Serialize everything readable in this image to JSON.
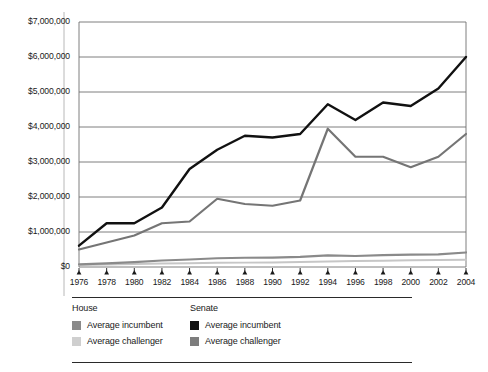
{
  "chart_data": {
    "type": "line",
    "title": "",
    "subtitle": "",
    "xlabel": "",
    "ylabel": "",
    "grid": true,
    "legend_position": "bottom",
    "x": [
      1976,
      1978,
      1980,
      1982,
      1984,
      1986,
      1988,
      1990,
      1992,
      1994,
      1996,
      1998,
      2000,
      2002,
      2004
    ],
    "categories": [
      "1976",
      "1978",
      "1980",
      "1982",
      "1984",
      "1986",
      "1988",
      "1990",
      "1992",
      "1994",
      "1996",
      "1998",
      "2000",
      "2002",
      "2004"
    ],
    "xlim": [
      1976,
      2004
    ],
    "ylim": [
      0,
      7000000
    ],
    "ytick_values": [
      0,
      1000000,
      2000000,
      3000000,
      4000000,
      5000000,
      6000000,
      7000000
    ],
    "ytick_labels": [
      "$0",
      "$1,000,000",
      "$2,000,000",
      "$3,000,000",
      "$4,000,000",
      "$5,000,000",
      "$6,000,000",
      "$7,000,000"
    ],
    "series": [
      {
        "name": "Senate average incumbent",
        "group": "Senate",
        "label": "Average incumbent",
        "color": "#111111",
        "width": 2.4,
        "values": [
          610000,
          1250000,
          1250000,
          1700000,
          2800000,
          3350000,
          3750000,
          3700000,
          3800000,
          4650000,
          4200000,
          4700000,
          4600000,
          5100000,
          6000000
        ]
      },
      {
        "name": "Senate average challenger",
        "group": "Senate",
        "label": "Average challenger",
        "color": "#757575",
        "width": 2.2,
        "values": [
          500000,
          700000,
          900000,
          1250000,
          1300000,
          1950000,
          1800000,
          1750000,
          1900000,
          3950000,
          3150000,
          3150000,
          2850000,
          3150000,
          3800000
        ]
      },
      {
        "name": "House average challenger (light)",
        "group": "House",
        "label": "Average challenger",
        "color": "#c6c6c6",
        "width": 2.0,
        "values": [
          60000,
          70000,
          85000,
          100000,
          110000,
          120000,
          125000,
          130000,
          145000,
          160000,
          170000,
          180000,
          190000,
          200000,
          205000
        ]
      },
      {
        "name": "House average incumbent",
        "group": "House",
        "label": "Average incumbent",
        "color": "#8a8a8a",
        "width": 2.2,
        "values": [
          75000,
          105000,
          140000,
          185000,
          215000,
          250000,
          265000,
          270000,
          290000,
          330000,
          315000,
          340000,
          355000,
          360000,
          415000
        ]
      }
    ]
  },
  "legend": {
    "columns": [
      {
        "heading": "House",
        "entries": [
          {
            "label": "Average incumbent",
            "color": "#8a8a8a"
          },
          {
            "label": "Average challenger",
            "color": "#cfcfcf"
          }
        ]
      },
      {
        "heading": "Senate",
        "entries": [
          {
            "label": "Average incumbent",
            "color": "#111111"
          },
          {
            "label": "Average challenger",
            "color": "#7d7d7d"
          }
        ]
      }
    ]
  }
}
